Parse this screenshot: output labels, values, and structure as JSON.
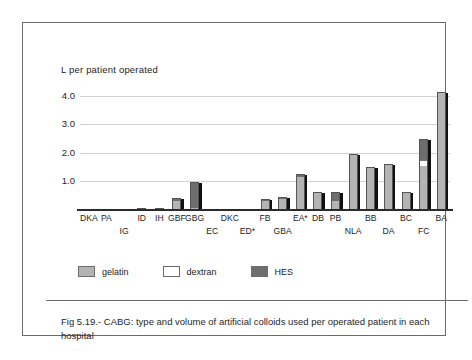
{
  "chart_data": {
    "type": "bar",
    "stacked": true,
    "title": "Fig 5.19.- CABG: type and volume of artificial  colloids used  per operated patient in each hospital",
    "xlabel": "",
    "ylabel": "L  per patient operated",
    "ylim": [
      0,
      4.4
    ],
    "yticks": [
      "1.0",
      "2.0",
      "3.0",
      "4.0"
    ],
    "ytick_values": [
      1.0,
      2.0,
      3.0,
      4.0
    ],
    "grid": true,
    "legend_position": "below-axis-left",
    "categories": [
      "DKA",
      "PA",
      "IG",
      "ID",
      "IH",
      "GBF",
      "GBG",
      "EC",
      "DKC",
      "ED*",
      "FB",
      "GBA",
      "EA*",
      "DB",
      "PB",
      "NLA",
      "BB",
      "DA",
      "BC",
      "FC",
      "BA"
    ],
    "category_rows": [
      0,
      0,
      1,
      0,
      0,
      0,
      0,
      1,
      0,
      1,
      0,
      1,
      0,
      0,
      0,
      1,
      0,
      1,
      0,
      1,
      0
    ],
    "series": [
      {
        "name": "gelatin",
        "color": "#b4b4b4",
        "values": [
          0,
          0,
          0,
          0.03,
          0.03,
          0.33,
          0.05,
          0,
          0,
          0,
          0.3,
          0.38,
          1.18,
          0.62,
          0.3,
          1.95,
          1.5,
          1.58,
          0.62,
          1.55,
          4.15
        ]
      },
      {
        "name": "dextran",
        "color": "#ffffff",
        "values": [
          0,
          0,
          0,
          0,
          0,
          0,
          0,
          0,
          0,
          0,
          0,
          0,
          0,
          0,
          0,
          0,
          0,
          0,
          0,
          0.2,
          0
        ]
      },
      {
        "name": "HES",
        "color": "#6e6e6e",
        "values": [
          0,
          0,
          0,
          0,
          0,
          0.05,
          0.9,
          0,
          0,
          0,
          0.05,
          0.03,
          0.05,
          0,
          0.32,
          0,
          0,
          0,
          0,
          0.75,
          0
        ]
      }
    ],
    "totals": [
      0,
      0,
      0,
      0.03,
      0.03,
      0.38,
      0.95,
      0,
      0,
      0,
      0.35,
      0.41,
      1.23,
      0.62,
      0.62,
      1.95,
      1.5,
      1.58,
      0.62,
      2.5,
      4.15
    ]
  },
  "legend": {
    "items": [
      {
        "label": "gelatin",
        "swatch": "gelatin"
      },
      {
        "label": "dextran",
        "swatch": "dextran"
      },
      {
        "label": "HES",
        "swatch": "hes"
      }
    ]
  },
  "caption": {
    "text": "Fig 5.19.- CABG: type and volume of artificial  colloids used  per operated patient in each hospital"
  }
}
